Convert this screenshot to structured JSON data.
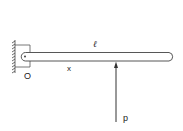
{
  "diagram": {
    "type": "cantilever-beam",
    "labels": {
      "length": "ℓ",
      "position": "x",
      "origin": "O",
      "load": "p"
    },
    "colors": {
      "stroke": "#444444",
      "background": "#ffffff"
    }
  }
}
